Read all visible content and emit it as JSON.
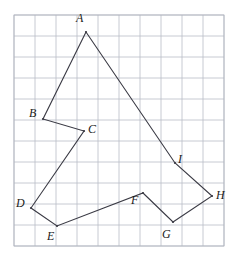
{
  "figure": {
    "kind": "polygon-on-grid",
    "background_color": "#ffffff",
    "grid": {
      "origin_x": 14,
      "origin_y": 15,
      "cell": 21,
      "cols": 10,
      "rows": 11,
      "line_color": "#b9bcc6",
      "border_color": "#b0b3bd",
      "line_width": 0.8,
      "visible": true
    },
    "outline": {
      "stroke_color": "#3a3a44",
      "stroke_width": 1.1,
      "closed": true,
      "fill": "none"
    },
    "vertices": [
      {
        "name": "A",
        "x": 86,
        "y": 32,
        "label": "A",
        "label_x": 76,
        "label_y": 12
      },
      {
        "name": "B",
        "x": 43,
        "y": 119,
        "label": "B",
        "label_x": 29,
        "label_y": 107
      },
      {
        "name": "C",
        "x": 84,
        "y": 131,
        "label": "C",
        "label_x": 88,
        "label_y": 123
      },
      {
        "name": "D",
        "x": 31,
        "y": 208,
        "label": "D",
        "label_x": 16,
        "label_y": 197
      },
      {
        "name": "E",
        "x": 57,
        "y": 226,
        "label": "E",
        "label_x": 47,
        "label_y": 230
      },
      {
        "name": "F",
        "x": 143,
        "y": 193,
        "label": "F",
        "label_x": 131,
        "label_y": 194
      },
      {
        "name": "G",
        "x": 173,
        "y": 222,
        "label": "G",
        "label_x": 162,
        "label_y": 228
      },
      {
        "name": "H",
        "x": 212,
        "y": 196,
        "label": "H",
        "label_x": 216,
        "label_y": 189
      },
      {
        "name": "I",
        "x": 175,
        "y": 163,
        "label": "I",
        "label_x": 178,
        "label_y": 153
      }
    ],
    "edges": [
      {
        "from": "A",
        "to": "B"
      },
      {
        "from": "B",
        "to": "C"
      },
      {
        "from": "C",
        "to": "D"
      },
      {
        "from": "D",
        "to": "E"
      },
      {
        "from": "E",
        "to": "F"
      },
      {
        "from": "F",
        "to": "G"
      },
      {
        "from": "G",
        "to": "H"
      },
      {
        "from": "H",
        "to": "I"
      },
      {
        "from": "I",
        "to": "A"
      }
    ]
  }
}
